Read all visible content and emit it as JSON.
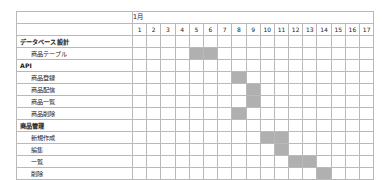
{
  "chart_data": {
    "type": "bar",
    "title": "",
    "xlabel": "",
    "ylabel": "",
    "month_label": "1月",
    "day_count": 17,
    "days": [
      "1",
      "2",
      "3",
      "4",
      "5",
      "6",
      "7",
      "8",
      "9",
      "10",
      "11",
      "12",
      "13",
      "14",
      "15",
      "16",
      "17"
    ],
    "categories": [
      "データベース設計",
      "商品テーブル",
      "API",
      "商品登録",
      "商品配信",
      "商品一覧",
      "商品削除",
      "商品管理",
      "新規作成",
      "編集",
      "一覧",
      "削除"
    ],
    "bar_color": "#b0b0b0",
    "grid": true,
    "rows": [
      {
        "label": "データベース設計",
        "type": "group",
        "start": null,
        "end": null
      },
      {
        "label": "商品テーブル",
        "type": "task",
        "start": 5,
        "end": 6
      },
      {
        "label": "API",
        "type": "group",
        "start": null,
        "end": null
      },
      {
        "label": "商品登録",
        "type": "task",
        "start": 8,
        "end": 8
      },
      {
        "label": "商品配信",
        "type": "task",
        "start": 9,
        "end": 9
      },
      {
        "label": "商品一覧",
        "type": "task",
        "start": 9,
        "end": 9
      },
      {
        "label": "商品削除",
        "type": "task",
        "start": 8,
        "end": 8
      },
      {
        "label": "商品管理",
        "type": "group",
        "start": null,
        "end": null
      },
      {
        "label": "新規作成",
        "type": "task",
        "start": 10,
        "end": 11
      },
      {
        "label": "編集",
        "type": "task",
        "start": 11,
        "end": 11
      },
      {
        "label": "一覧",
        "type": "task",
        "start": 12,
        "end": 13
      },
      {
        "label": "削除",
        "type": "task",
        "start": 14,
        "end": 14
      }
    ]
  }
}
